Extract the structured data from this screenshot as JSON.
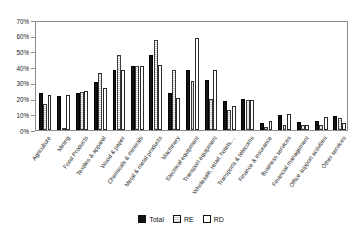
{
  "chart_data": {
    "type": "bar",
    "title": "",
    "xlabel": "",
    "ylabel": "",
    "ylim": [
      0,
      70
    ],
    "ytick_labels": [
      "0%",
      "10%",
      "20%",
      "30%",
      "40%",
      "50%",
      "60%",
      "70%"
    ],
    "ytick_values": [
      0,
      10,
      20,
      30,
      40,
      50,
      60,
      70
    ],
    "grid": false,
    "legend_position": "bottom",
    "categories": [
      "Agriculture",
      "Mining",
      "Food Products",
      "Textiles & apparel",
      "Wood & paper",
      "Chemicals & minerals",
      "Metal & metal products",
      "Machinery",
      "Electrical equipment",
      "Transport equipment",
      "Wholesale, retail, hotels,...",
      "Transports & telecoms",
      "Finance & insurance",
      "Business services",
      "Financial management",
      "Office support activities",
      "Other services"
    ],
    "series": [
      {
        "name": "Total",
        "values": [
          23.5,
          21.5,
          23.5,
          30.5,
          38.0,
          40.5,
          47.5,
          23.5,
          38.5,
          32.0,
          18.5,
          19.5,
          4.5,
          9.5,
          5.0,
          5.5,
          9.0
        ]
      },
      {
        "name": "RE",
        "values": [
          16.5,
          0.0,
          24.0,
          36.0,
          47.5,
          40.5,
          57.5,
          38.0,
          31.0,
          20.0,
          12.5,
          19.0,
          2.0,
          3.5,
          3.5,
          3.0,
          7.5
        ]
      },
      {
        "name": "RD",
        "values": [
          22.5,
          22.0,
          25.0,
          26.5,
          38.0,
          40.5,
          41.5,
          20.5,
          58.5,
          38.5,
          15.5,
          19.0,
          5.5,
          10.5,
          3.0,
          8.5,
          4.5
        ]
      }
    ]
  },
  "legend": {
    "items": [
      {
        "label": "Total",
        "style": "total"
      },
      {
        "label": "RE",
        "style": "re"
      },
      {
        "label": "RD",
        "style": "rd"
      }
    ]
  }
}
